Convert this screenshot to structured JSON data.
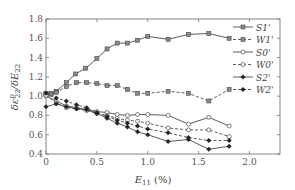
{
  "chart_data": {
    "type": "line",
    "title": "",
    "xlabel": "E11 (%)",
    "ylabel": "δε^p_22 / δE_22",
    "xlim": [
      0,
      2.3
    ],
    "ylim": [
      0.4,
      1.8
    ],
    "xticks": [
      0,
      0.5,
      1.0,
      1.5,
      2.0
    ],
    "xtick_labels": [
      "0",
      "0.5",
      "1.0",
      "1.5",
      "2.0"
    ],
    "yticks": [
      0.4,
      0.6,
      0.8,
      1.0,
      1.2,
      1.4,
      1.6,
      1.8
    ],
    "ytick_labels": [
      "0.4",
      "0.6",
      "0.8",
      "1.0",
      "1.2",
      "1.4",
      "1.6",
      "1.8"
    ],
    "grid": false,
    "legend_position": "upper right",
    "series": [
      {
        "name": "S1'",
        "line": "solid",
        "marker": "square",
        "x": [
          0,
          0.05,
          0.1,
          0.2,
          0.29,
          0.39,
          0.5,
          0.6,
          0.7,
          0.8,
          0.9,
          1.0,
          1.2,
          1.4,
          1.6,
          1.8
        ],
        "y": [
          1.03,
          1.03,
          1.05,
          1.14,
          1.23,
          1.29,
          1.39,
          1.49,
          1.55,
          1.55,
          1.58,
          1.62,
          1.59,
          1.64,
          1.65,
          1.6
        ]
      },
      {
        "name": "W1'",
        "line": "dashed",
        "marker": "square",
        "x": [
          0,
          0.05,
          0.1,
          0.2,
          0.3,
          0.4,
          0.5,
          0.6,
          0.7,
          0.8,
          0.9,
          1.0,
          1.2,
          1.4,
          1.6,
          1.8
        ],
        "y": [
          1.02,
          1.02,
          1.04,
          1.1,
          1.14,
          1.14,
          1.13,
          1.11,
          1.11,
          1.07,
          1.03,
          1.03,
          1.05,
          1.03,
          0.95,
          1.07
        ]
      },
      {
        "name": "S0'",
        "line": "solid",
        "marker": "circle",
        "x": [
          0,
          0.1,
          0.2,
          0.3,
          0.4,
          0.5,
          0.6,
          0.7,
          0.8,
          0.9,
          1.0,
          1.2,
          1.4,
          1.6,
          1.8
        ],
        "y": [
          1.0,
          0.95,
          0.9,
          0.88,
          0.86,
          0.84,
          0.83,
          0.81,
          0.8,
          0.81,
          0.81,
          0.8,
          0.71,
          0.78,
          0.69
        ]
      },
      {
        "name": "W0'",
        "line": "dashed",
        "marker": "circle",
        "x": [
          0,
          0.1,
          0.2,
          0.3,
          0.4,
          0.5,
          0.6,
          0.7,
          0.8,
          0.9,
          1.0,
          1.2,
          1.4,
          1.6,
          1.8
        ],
        "y": [
          1.01,
          0.93,
          0.88,
          0.87,
          0.85,
          0.82,
          0.8,
          0.77,
          0.75,
          0.74,
          0.72,
          0.67,
          0.65,
          0.65,
          0.58
        ]
      },
      {
        "name": "S2'",
        "line": "solid",
        "marker": "filled-diamond",
        "x": [
          0,
          0.1,
          0.2,
          0.3,
          0.4,
          0.5,
          0.6,
          0.7,
          0.8,
          0.9,
          1.0,
          1.2,
          1.4,
          1.6,
          1.8
        ],
        "y": [
          0.89,
          0.92,
          0.89,
          0.87,
          0.86,
          0.82,
          0.77,
          0.72,
          0.68,
          0.63,
          0.6,
          0.53,
          0.55,
          0.45,
          0.48
        ]
      },
      {
        "name": "W2'",
        "line": "dashed",
        "marker": "filled-diamond",
        "x": [
          0,
          0.1,
          0.2,
          0.3,
          0.4,
          0.5,
          0.6,
          0.7,
          0.8,
          0.9,
          1.0,
          1.2,
          1.4,
          1.6,
          1.8
        ],
        "y": [
          1.03,
          0.98,
          0.95,
          0.91,
          0.88,
          0.83,
          0.79,
          0.75,
          0.72,
          0.69,
          0.66,
          0.62,
          0.57,
          0.54,
          0.54
        ]
      }
    ]
  },
  "legend": {
    "items": [
      {
        "label": "S1'",
        "dash": "",
        "marker": "square"
      },
      {
        "label": "W1'",
        "dash": "3,2",
        "marker": "square"
      },
      {
        "label": "S0'",
        "dash": "",
        "marker": "circle"
      },
      {
        "label": "W0'",
        "dash": "3,2",
        "marker": "circle"
      },
      {
        "label": "S2'",
        "dash": "",
        "marker": "diamond"
      },
      {
        "label": "W2'",
        "dash": "3,2",
        "marker": "diamond"
      }
    ]
  },
  "axes": {
    "x_label_main": "E",
    "x_label_sub": "11",
    "x_label_unit": " (%)",
    "y_label": "δε",
    "y_label_rest": "/δE",
    "y_label_sup": "p",
    "y_label_sub1": "22",
    "y_label_sub2": "22"
  },
  "colors": {
    "line": "#4a4a4a",
    "axis": "#666666",
    "marker_fill": "#888888"
  }
}
